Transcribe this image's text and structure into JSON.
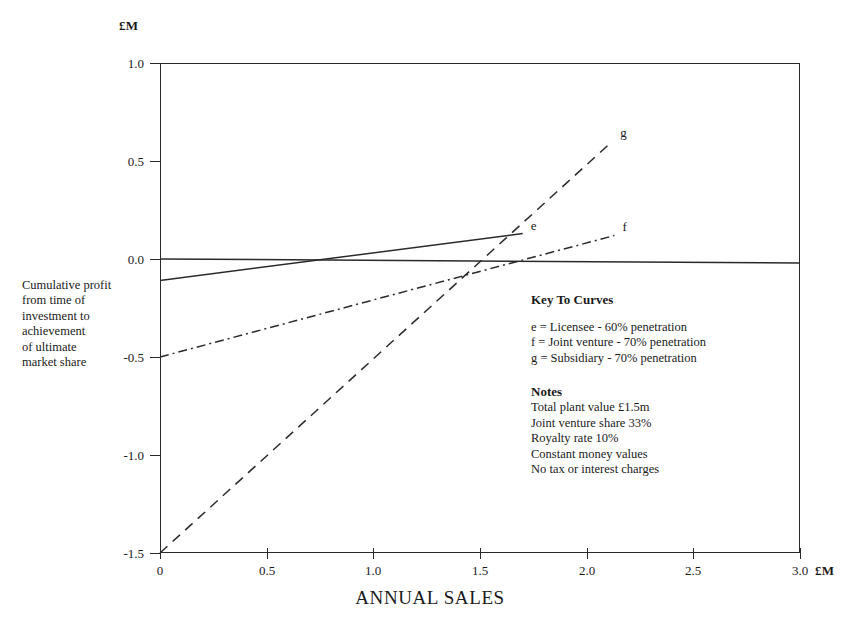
{
  "chart_data": {
    "type": "line",
    "title": "",
    "xlabel": "ANNUAL SALES",
    "ylabel": "Cumulative profit from time of investment to achievement of ultimate market share",
    "x_unit": "£M",
    "y_unit": "£M",
    "xlim": [
      0,
      3.0
    ],
    "ylim": [
      -1.5,
      1.0
    ],
    "xticks": [
      0,
      0.5,
      1.0,
      1.5,
      2.0,
      2.5,
      3.0
    ],
    "xticklabels": [
      "0",
      "0.5",
      "1.0",
      "1.5",
      "2.0",
      "2.5",
      "3.0"
    ],
    "yticks": [
      1.0,
      0.5,
      0.0,
      -0.5,
      -1.0,
      -1.5
    ],
    "yticklabels": [
      "1.0",
      "0.5",
      "0.0",
      "-0.5",
      "-1.0",
      "-1.5"
    ],
    "grid": false,
    "legend_position": "inside-lower-right",
    "series": [
      {
        "name": "e",
        "label": "e",
        "style": "solid",
        "description": "Licensee - 60% penetration",
        "x": [
          0,
          1.7
        ],
        "y": [
          -0.11,
          0.13
        ]
      },
      {
        "name": "f",
        "label": "f",
        "style": "dashdot",
        "description": "Joint venture - 70% penetration",
        "x": [
          0,
          2.13
        ],
        "y": [
          -0.5,
          0.12
        ]
      },
      {
        "name": "g",
        "label": "g",
        "style": "dashed",
        "description": "Subsidiary - 70% penetration",
        "x": [
          0,
          2.12
        ],
        "y": [
          -1.5,
          0.6
        ]
      },
      {
        "name": "baseline",
        "label": "",
        "style": "solid",
        "description": "zero reference baseline",
        "x": [
          0,
          3.0
        ],
        "y": [
          0.0,
          -0.02
        ]
      }
    ]
  },
  "axis": {
    "y_unit_label": "£M",
    "x_unit_label": "£M",
    "x_title": "ANNUAL SALES",
    "y_caption_lines": [
      "Cumulative profit",
      "from time of",
      "investment to",
      "achievement",
      "of ultimate",
      "market share"
    ]
  },
  "key": {
    "heading": "Key To Curves",
    "entries": [
      "e = Licensee - 60% penetration",
      "f = Joint venture - 70% penetration",
      "g = Subsidiary - 70% penetration"
    ],
    "notes_heading": "Notes",
    "notes": [
      "Total plant value £1.5m",
      "Joint venture share 33%",
      "Royalty rate 10%",
      "Constant money values",
      "No tax or interest charges"
    ]
  },
  "colors": {
    "line": "#2a2a2a",
    "text": "#1a1a1a",
    "background": "#ffffff"
  }
}
